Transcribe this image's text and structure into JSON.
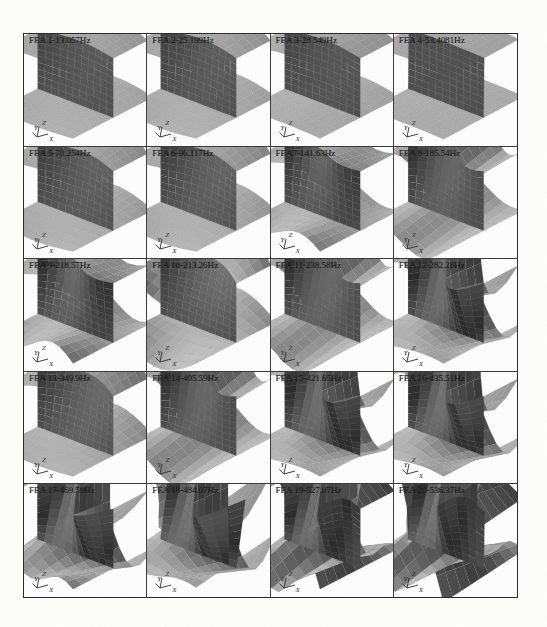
{
  "figure": {
    "rows": 5,
    "columns": 4,
    "axis_labels": {
      "x": "X",
      "y": "Y",
      "z": "Z"
    },
    "unit": "Hz",
    "colors": {
      "ink": "#1b1b1b",
      "frame": "#2a2a2a",
      "divider": "#3a3a3a",
      "page": "#fdfdfc",
      "surface_light": "#b4b4b4",
      "surface_mid": "#8d8d8d",
      "surface_dark": "#5d5d5d",
      "surface_darkest": "#3c3c3c",
      "mesh": "#6b6b6b"
    }
  },
  "panels": [
    {
      "label": "FEA 1-13.057Hz",
      "mode": 1,
      "frequency_hz": 13.057,
      "shape": "t-beam-twist-1"
    },
    {
      "label": "FEA 2-25.199Hz",
      "mode": 2,
      "frequency_hz": 25.199,
      "shape": "t-beam-twist-2"
    },
    {
      "label": "FEA 3-28.549Hz",
      "mode": 3,
      "frequency_hz": 28.549,
      "shape": "t-beam-bend-1"
    },
    {
      "label": "FEA 4-53.4081Hz",
      "mode": 4,
      "frequency_hz": 53.4081,
      "shape": "t-beam-flat"
    },
    {
      "label": "FEA 5-70.254Hz",
      "mode": 5,
      "frequency_hz": 70.254,
      "shape": "t-beam-twist-3"
    },
    {
      "label": "FEA 6-96.117Hz",
      "mode": 6,
      "frequency_hz": 96.117,
      "shape": "t-beam-twist-4"
    },
    {
      "label": "FEA7-141.63Hz",
      "mode": 7,
      "frequency_hz": 141.63,
      "shape": "t-beam-wave-1"
    },
    {
      "label": "FEA 8-185.54Hz",
      "mode": 8,
      "frequency_hz": 185.54,
      "shape": "t-beam-wave-2"
    },
    {
      "label": "FEA 9-218.57Hz",
      "mode": 9,
      "frequency_hz": 218.57,
      "shape": "t-beam-wave-3"
    },
    {
      "label": "FEA 10-213.26Hz",
      "mode": 10,
      "frequency_hz": 213.26,
      "shape": "t-beam-saddle-1"
    },
    {
      "label": "FEA 11-238.58Hz",
      "mode": 11,
      "frequency_hz": 238.58,
      "shape": "t-beam-saddle-2"
    },
    {
      "label": "FEA 12-282.28Hz",
      "mode": 12,
      "frequency_hz": 282.28,
      "shape": "t-beam-saddle-3"
    },
    {
      "label": "FEA 13-349.9Hz",
      "mode": 13,
      "frequency_hz": 349.9,
      "shape": "t-beam-wave-4"
    },
    {
      "label": "FEA 14-405.59Hz",
      "mode": 14,
      "frequency_hz": 405.59,
      "shape": "t-beam-wave-5"
    },
    {
      "label": "FEA 15-421.65Hz",
      "mode": 15,
      "frequency_hz": 421.65,
      "shape": "t-beam-wave-6"
    },
    {
      "label": "FEA 16-435.51Hz",
      "mode": 16,
      "frequency_hz": 435.51,
      "shape": "t-beam-wave-7"
    },
    {
      "label": "FEA 17-469.59Hz",
      "mode": 17,
      "frequency_hz": 469.59,
      "shape": "t-beam-complex-1"
    },
    {
      "label": "FEA 18-484.07Hz",
      "mode": 18,
      "frequency_hz": 484.07,
      "shape": "t-beam-complex-2"
    },
    {
      "label": "FEA 19-527.07Hz",
      "mode": 19,
      "frequency_hz": 527.07,
      "shape": "t-beam-complex-3"
    },
    {
      "label": "FEA 20-536.37Hz",
      "mode": 20,
      "frequency_hz": 536.37,
      "shape": "t-beam-complex-4"
    }
  ],
  "chart_data": {
    "type": "table",
    "xlabel": "Mode number",
    "ylabel": "Frequency (Hz)",
    "categories": [
      "1",
      "2",
      "3",
      "4",
      "5",
      "6",
      "7",
      "8",
      "9",
      "10",
      "11",
      "12",
      "13",
      "14",
      "15",
      "16",
      "17",
      "18",
      "19",
      "20"
    ],
    "values": [
      13.057,
      25.199,
      28.549,
      53.4081,
      70.254,
      96.117,
      141.63,
      185.54,
      218.57,
      213.26,
      238.58,
      282.28,
      349.9,
      405.59,
      421.65,
      435.51,
      469.59,
      484.07,
      527.07,
      536.37
    ],
    "legend": [
      "FEA mode shape"
    ],
    "grid": true,
    "ylim": [
      0,
      600
    ]
  }
}
